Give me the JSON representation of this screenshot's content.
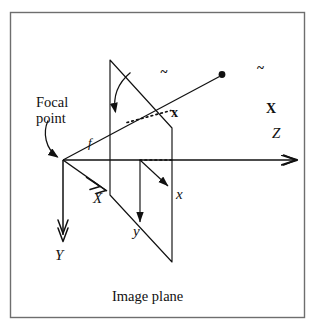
{
  "figure": {
    "caption": "Image plane",
    "border_color": "#6e6e6e",
    "background": "#ffffff",
    "line_color": "#111111",
    "labels": {
      "focal_point_line1": "Focal",
      "focal_point_line2": "point",
      "focal_length": "f",
      "axis_X": "X",
      "axis_Y": "Y",
      "axis_Z": "Z",
      "axis_x": "x",
      "axis_y": "y",
      "image_point_base": "x",
      "image_point_tilde": "~",
      "world_point_base": "X",
      "world_point_tilde": "~",
      "caption": "Image plane"
    },
    "geometry": {
      "origin": [
        63,
        160
      ],
      "image_plane_vertices": [
        [
          110,
          60
        ],
        [
          172,
          128
        ],
        [
          172,
          262
        ],
        [
          110,
          195
        ]
      ],
      "world_point": [
        224,
        74
      ],
      "image_point": [
        123,
        114
      ],
      "z_axis_end": [
        300,
        160
      ]
    }
  }
}
